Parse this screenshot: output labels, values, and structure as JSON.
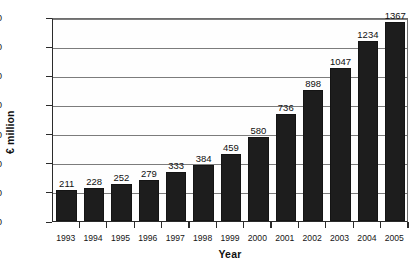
{
  "chart_data": {
    "type": "bar",
    "title": "",
    "xlabel": "Year",
    "ylabel": "€ million",
    "categories": [
      "1993",
      "1994",
      "1995",
      "1996",
      "1997",
      "1998",
      "1999",
      "2000",
      "2001",
      "2002",
      "2003",
      "2004",
      "2005"
    ],
    "values": [
      211,
      228,
      252,
      279,
      333,
      384,
      459,
      580,
      736,
      898,
      1047,
      1234,
      1367
    ],
    "value_labels": [
      "211",
      "228",
      "252",
      "279",
      "333",
      "384",
      "459",
      "580",
      "736",
      "898",
      "1047",
      "1234",
      "1367"
    ],
    "ylim": [
      0,
      1400
    ],
    "y_ticks": [
      0,
      200,
      400,
      600,
      800,
      1000,
      1200,
      1400
    ],
    "y_tick_labels": [
      "0",
      "200",
      "400",
      "600",
      "800",
      "1000",
      "1200",
      "1400"
    ],
    "grid": true,
    "grid_axis": "y",
    "legend": null,
    "bar_color": "#1d1d1d",
    "grid_color": "#7c7c7c",
    "axis_color": "#2b2b2b",
    "background_color": "#ffffff"
  }
}
